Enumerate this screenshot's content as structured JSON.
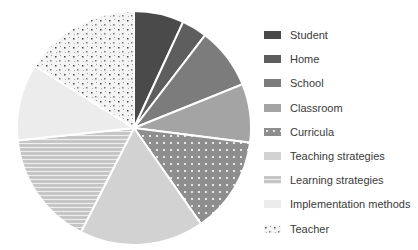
{
  "chart_data": {
    "type": "pie",
    "title": "",
    "start_angle_deg": 0,
    "direction": "clockwise",
    "legend_position": "right",
    "categories": [
      "Student",
      "Home",
      "School",
      "Classroom",
      "Curricula",
      "Teaching strategies",
      "Learning strategies",
      "Implementation methods",
      "Teacher"
    ],
    "values": [
      6.9,
      3.5,
      8.5,
      8.1,
      13.3,
      17.2,
      15.8,
      10.6,
      16.1
    ],
    "slices": [
      {
        "label": "Student",
        "value": 6.9,
        "color": "#4a4a4a",
        "pattern": "solid"
      },
      {
        "label": "Home",
        "value": 3.5,
        "color": "#5e5e5e",
        "pattern": "solid"
      },
      {
        "label": "School",
        "value": 8.5,
        "color": "#7c7c7c",
        "pattern": "solid"
      },
      {
        "label": "Classroom",
        "value": 8.1,
        "color": "#a4a4a4",
        "pattern": "solid"
      },
      {
        "label": "Curricula",
        "value": 13.3,
        "color": "#8e8e8e",
        "pattern": "dots-light"
      },
      {
        "label": "Teaching strategies",
        "value": 17.2,
        "color": "#d2d2d2",
        "pattern": "solid"
      },
      {
        "label": "Learning strategies",
        "value": 15.8,
        "color": "#c6c6c6",
        "pattern": "horizontal-stripes"
      },
      {
        "label": "Implementation methods",
        "value": 10.6,
        "color": "#ececec",
        "pattern": "solid"
      },
      {
        "label": "Teacher",
        "value": 16.1,
        "color": "#f4f4f4",
        "pattern": "dots-dark"
      }
    ]
  }
}
